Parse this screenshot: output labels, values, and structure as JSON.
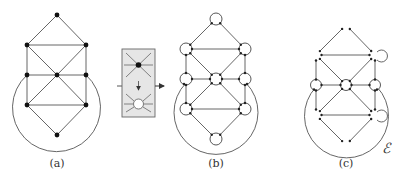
{
  "panels": [
    {
      "id": "a",
      "label": "(a)",
      "label_x": 57,
      "label_y": 157
    },
    {
      "id": "b",
      "label": "(b)",
      "label_x": 216,
      "label_y": 157
    },
    {
      "id": "c",
      "label": "(c)",
      "label_x": 346,
      "label_y": 157
    }
  ],
  "outer_face_label": "ℰ",
  "transform_box": {
    "description": "vertex expansion: filled vertex becomes small circle with ports"
  },
  "graph": {
    "nodes": [
      {
        "id": "top",
        "x": 0,
        "y": 0
      },
      {
        "id": "ul",
        "x": -30,
        "y": 30
      },
      {
        "id": "ur",
        "x": 29,
        "y": 30
      },
      {
        "id": "ml",
        "x": -30,
        "y": 60
      },
      {
        "id": "c",
        "x": 0,
        "y": 60
      },
      {
        "id": "mr",
        "x": 29,
        "y": 60
      },
      {
        "id": "ll",
        "x": -30,
        "y": 90
      },
      {
        "id": "lr",
        "x": 29,
        "y": 90
      },
      {
        "id": "bot",
        "x": 0,
        "y": 120
      }
    ],
    "edges": [
      [
        "top",
        "ul"
      ],
      [
        "top",
        "ur"
      ],
      [
        "ul",
        "ur"
      ],
      [
        "ul",
        "ml"
      ],
      [
        "ur",
        "mr"
      ],
      [
        "ul",
        "c"
      ],
      [
        "ur",
        "c"
      ],
      [
        "ml",
        "c"
      ],
      [
        "c",
        "mr"
      ],
      [
        "ml",
        "ll"
      ],
      [
        "mr",
        "lr"
      ],
      [
        "c",
        "ll"
      ],
      [
        "c",
        "lr"
      ],
      [
        "ll",
        "lr"
      ],
      [
        "ll",
        "bot"
      ],
      [
        "lr",
        "bot"
      ]
    ]
  }
}
